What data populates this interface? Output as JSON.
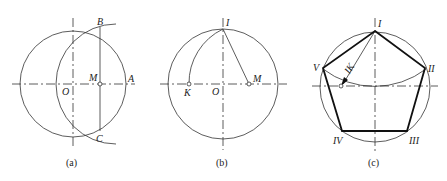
{
  "figure": {
    "panels": [
      {
        "id": "a",
        "caption": "(a)",
        "labels": {
          "B": "B",
          "M": "M",
          "A": "A",
          "O": "O",
          "C": "C"
        }
      },
      {
        "id": "b",
        "caption": "(b)",
        "labels": {
          "I": "I",
          "K": "K",
          "O": "O",
          "M": "M"
        }
      },
      {
        "id": "c",
        "caption": "(c)",
        "labels": {
          "I": "I",
          "II": "II",
          "III": "III",
          "IV": "IV",
          "V": "V",
          "IK": "IK"
        }
      }
    ]
  }
}
